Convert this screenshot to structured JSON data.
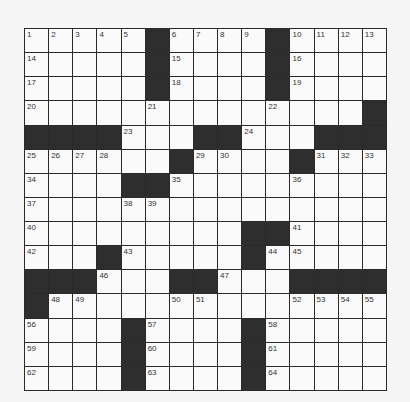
{
  "puzzle": {
    "rows": 15,
    "cols": 15,
    "colors": {
      "block": "#2e2e2e",
      "cell": "#fafafa",
      "line": "#2a2a2a",
      "number": "#333333"
    },
    "grid": [
      [
        1,
        2,
        3,
        4,
        5,
        "#",
        6,
        7,
        8,
        9,
        "#",
        10,
        11,
        12,
        13
      ],
      [
        14,
        0,
        0,
        0,
        0,
        "#",
        15,
        0,
        0,
        0,
        "#",
        16,
        0,
        0,
        0
      ],
      [
        17,
        0,
        0,
        0,
        0,
        "#",
        18,
        0,
        0,
        0,
        "#",
        19,
        0,
        0,
        0
      ],
      [
        20,
        0,
        0,
        0,
        0,
        21,
        0,
        0,
        0,
        0,
        22,
        0,
        0,
        0,
        "#"
      ],
      [
        "#",
        "#",
        "#",
        "#",
        23,
        0,
        0,
        "#",
        "#",
        24,
        0,
        0,
        "#",
        "#",
        "#"
      ],
      [
        25,
        26,
        27,
        28,
        0,
        0,
        "#",
        29,
        30,
        0,
        0,
        "#",
        31,
        32,
        33
      ],
      [
        34,
        0,
        0,
        0,
        "#",
        "#",
        35,
        0,
        0,
        0,
        0,
        36,
        0,
        0,
        0
      ],
      [
        37,
        0,
        0,
        0,
        38,
        39,
        0,
        0,
        0,
        0,
        0,
        0,
        0,
        0,
        0
      ],
      [
        40,
        0,
        0,
        0,
        0,
        0,
        0,
        0,
        0,
        "#",
        "#",
        41,
        0,
        0,
        0
      ],
      [
        42,
        0,
        0,
        "#",
        43,
        0,
        0,
        0,
        0,
        "#",
        44,
        45,
        0,
        0,
        0
      ],
      [
        "#",
        "#",
        "#",
        46,
        0,
        0,
        "#",
        "#",
        47,
        0,
        0,
        "#",
        "#",
        "#",
        "#"
      ],
      [
        "#",
        48,
        49,
        0,
        0,
        0,
        50,
        51,
        0,
        0,
        0,
        52,
        53,
        54,
        55
      ],
      [
        56,
        0,
        0,
        0,
        "#",
        57,
        0,
        0,
        0,
        "#",
        58,
        0,
        0,
        0,
        0
      ],
      [
        59,
        0,
        0,
        0,
        "#",
        60,
        0,
        0,
        0,
        "#",
        61,
        0,
        0,
        0,
        0
      ],
      [
        62,
        0,
        0,
        0,
        "#",
        63,
        0,
        0,
        0,
        "#",
        64,
        0,
        0,
        0,
        0
      ]
    ],
    "entries": {}
  }
}
